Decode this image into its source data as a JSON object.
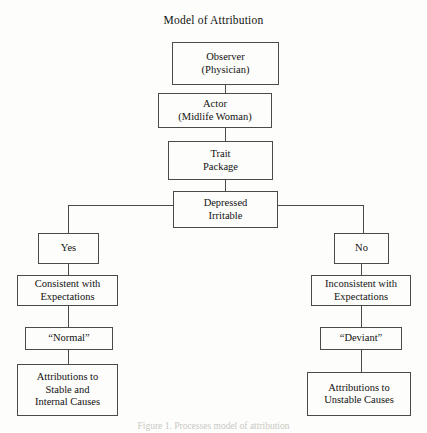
{
  "figure": {
    "title": "Model of Attribution",
    "caption": "Figure 1. Processes model of attribution"
  },
  "nodes": {
    "observer": {
      "line1": "Observer",
      "line2": "(Physician)"
    },
    "actor": {
      "line1": "Actor",
      "line2": "(Midlife Woman)"
    },
    "trait": {
      "line1": "Trait",
      "line2": "Package"
    },
    "symptom": {
      "line1": "Depressed",
      "line2": "Irritable"
    },
    "yes": {
      "line1": "Yes"
    },
    "no": {
      "line1": "No"
    },
    "consistent": {
      "line1": "Consistent with",
      "line2": "Expectations"
    },
    "inconsistent": {
      "line1": "Inconsistent with",
      "line2": "Expectations"
    },
    "normal": {
      "line1": "“Normal”"
    },
    "deviant": {
      "line1": "“Deviant”"
    },
    "stable_internal": {
      "line1": "Attributions to",
      "line2": "Stable and",
      "line3": "Internal Causes"
    },
    "unstable": {
      "line1": "Attributions to",
      "line2": "Unstable Causes"
    }
  },
  "colors": {
    "background": "#fdfdfb",
    "stroke": "#4a4a4a",
    "text": "#111111"
  }
}
